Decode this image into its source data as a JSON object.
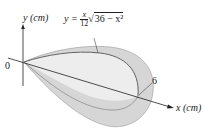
{
  "diagram": {
    "y_axis_label": "y (cm)",
    "x_axis_label": "x (cm)",
    "origin_label": "0",
    "tick_label_6": "6",
    "equation": {
      "lhs": "y =",
      "numerator": "x",
      "denominator": "12",
      "radical_symbol": "√",
      "radicand": "36 − x²"
    },
    "colors": {
      "outer_fill": "#d4d4d4",
      "inner_fill": "#ececec",
      "stroke": "#555555"
    }
  }
}
